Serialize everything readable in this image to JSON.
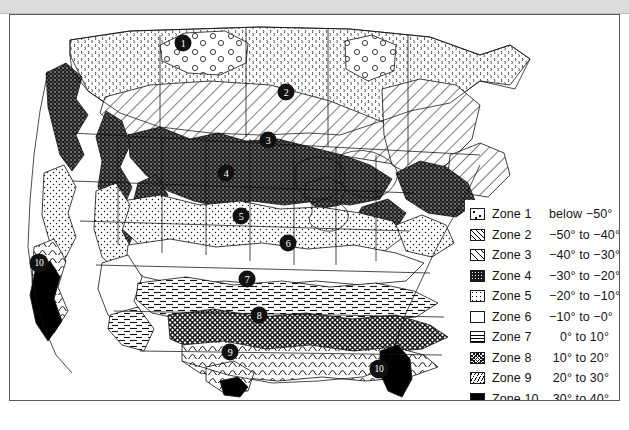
{
  "legend": {
    "title": "Hardiness Zones",
    "rows": [
      {
        "zone": "Zone 1",
        "range": "below −50°",
        "pattern": "rings",
        "swatch_name": "zone-1-swatch"
      },
      {
        "zone": "Zone 2",
        "range": "−50° to −40°",
        "pattern": "diag1",
        "swatch_name": "zone-2-swatch"
      },
      {
        "zone": "Zone 3",
        "range": "−40° to −30°",
        "pattern": "diag2",
        "swatch_name": "zone-3-swatch"
      },
      {
        "zone": "Zone 4",
        "range": "−30° to −20°",
        "pattern": "dense",
        "swatch_name": "zone-4-swatch"
      },
      {
        "zone": "Zone 5",
        "range": "−20° to −10°",
        "pattern": "dots",
        "swatch_name": "zone-5-swatch"
      },
      {
        "zone": "Zone 6",
        "range": "−10° to −0°",
        "pattern": "blank",
        "swatch_name": "zone-6-swatch"
      },
      {
        "zone": "Zone 7",
        "range": "0° to 10°",
        "pattern": "horiz",
        "swatch_name": "zone-7-swatch"
      },
      {
        "zone": "Zone 8",
        "range": "10° to 20°",
        "pattern": "cross",
        "swatch_name": "zone-8-swatch"
      },
      {
        "zone": "Zone 9",
        "range": "20° to 30°",
        "pattern": "diag3",
        "swatch_name": "zone-9-swatch"
      },
      {
        "zone": "Zone 10",
        "range": "30° to 40°",
        "pattern": "solid",
        "swatch_name": "zone-10-swatch"
      }
    ]
  },
  "map_markers": [
    {
      "label": "1",
      "x": 182,
      "y": 42,
      "region": "northern-canada"
    },
    {
      "label": "2",
      "x": 285,
      "y": 91,
      "region": "central-canada"
    },
    {
      "label": "3",
      "x": 267,
      "y": 139,
      "region": "northern-plains"
    },
    {
      "label": "4",
      "x": 225,
      "y": 172,
      "region": "upper-midwest"
    },
    {
      "label": "5",
      "x": 240,
      "y": 215,
      "region": "central-plains"
    },
    {
      "label": "6",
      "x": 287,
      "y": 242,
      "region": "midwest"
    },
    {
      "label": "7",
      "x": 246,
      "y": 278,
      "region": "southern-plains"
    },
    {
      "label": "8",
      "x": 258,
      "y": 314,
      "region": "southeast"
    },
    {
      "label": "9",
      "x": 229,
      "y": 351,
      "region": "south-texas"
    },
    {
      "label": "10",
      "x": 38,
      "y": 262,
      "region": "southern-california"
    },
    {
      "label": "10",
      "x": 378,
      "y": 368,
      "region": "south-florida"
    }
  ],
  "colors": {
    "page_background": "#ffffff",
    "top_band": "#dcdcdc",
    "frame_border": "#5a5a5a",
    "ink": "#111111",
    "marker_fill": "#111111",
    "marker_text": "#ffffff"
  }
}
